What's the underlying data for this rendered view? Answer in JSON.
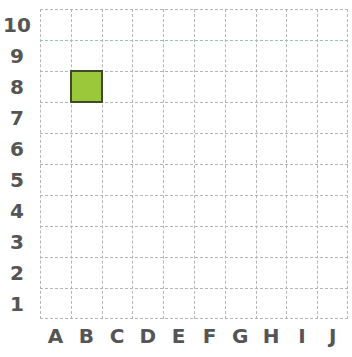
{
  "grid": {
    "columns": [
      "A",
      "B",
      "C",
      "D",
      "E",
      "F",
      "G",
      "H",
      "I",
      "J"
    ],
    "rows": [
      "10",
      "9",
      "8",
      "7",
      "6",
      "5",
      "4",
      "3",
      "2",
      "1"
    ],
    "cell_size": 31,
    "origin": {
      "left": 40,
      "top": 9
    },
    "gridline_color": "#b5b5b5",
    "highlight_line_color": "#8cc7c4"
  },
  "marked_cells": [
    {
      "column": "B",
      "row": "8",
      "fill": "#9bc83a",
      "border": "#3f4a2a"
    }
  ]
}
